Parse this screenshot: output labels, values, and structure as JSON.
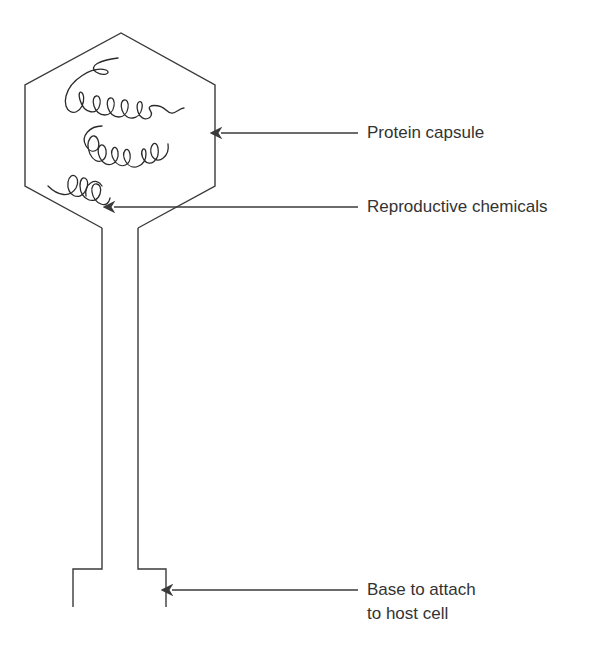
{
  "diagram": {
    "stroke_color": "#3a3a3a",
    "text_color": "#333333",
    "labels": [
      {
        "id": "protein-capsule",
        "text": "Protein capsule"
      },
      {
        "id": "reproductive-chemicals",
        "text": "Reproductive chemicals"
      },
      {
        "id": "base",
        "lines": [
          "Base to attach",
          "to host cell"
        ]
      }
    ]
  }
}
